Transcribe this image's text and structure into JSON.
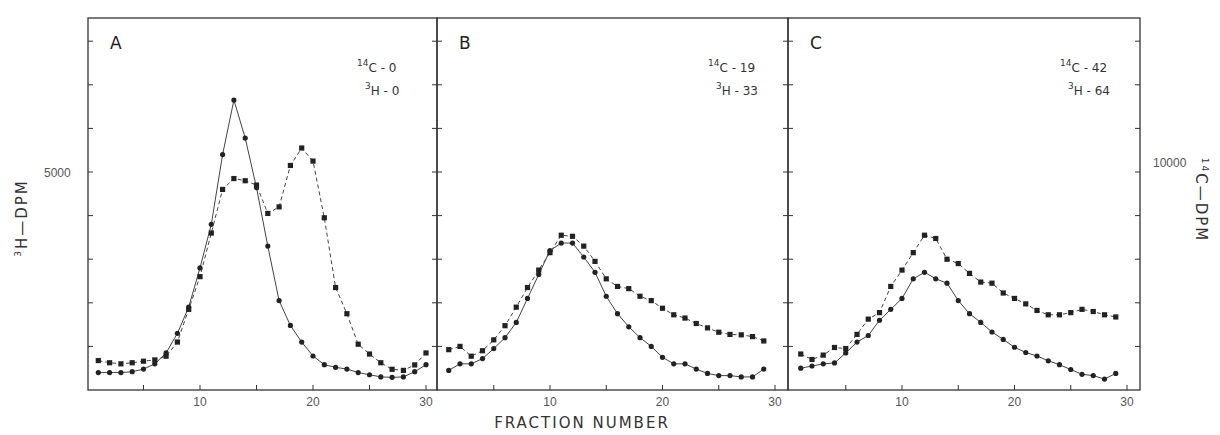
{
  "figure": {
    "y_left_label_sup": "3",
    "y_left_label": "H—DPM",
    "y_right_label_sup": "14",
    "y_right_label": "C—DPM",
    "x_label": "FRACTION NUMBER",
    "y_left_tick_label": "5000",
    "y_right_tick_label": "10000"
  },
  "chart_data": [
    {
      "type": "line",
      "panel": "A",
      "title": "A",
      "annotation": {
        "c14_label": "14C - 0",
        "h3_label": "3H - 0",
        "c14_sup": "14",
        "c14_text": "C - 0",
        "h3_sup": "3",
        "h3_text": "H - 0"
      },
      "xlabel": "FRACTION NUMBER",
      "ylabel": "3H-DPM",
      "ylabel_right": "14C-DPM",
      "xlim": [
        0,
        31
      ],
      "xticks": [
        10,
        20,
        30
      ],
      "ylim_left": [
        0,
        8000
      ],
      "ylim_right": [
        0,
        16000
      ],
      "x": [
        1,
        2,
        3,
        4,
        5,
        6,
        7,
        8,
        9,
        10,
        11,
        12,
        13,
        14,
        15,
        16,
        17,
        18,
        19,
        20,
        21,
        22,
        23,
        24,
        25,
        26,
        27,
        28,
        29,
        30
      ],
      "series": [
        {
          "name": "3H (solid, circles)",
          "axis": "left",
          "style": "solid",
          "values": [
            400,
            400,
            400,
            420,
            480,
            600,
            850,
            1300,
            1900,
            2800,
            3800,
            5400,
            6650,
            5780,
            4640,
            3300,
            2050,
            1480,
            1100,
            780,
            580,
            520,
            480,
            400,
            350,
            300,
            290,
            300,
            420,
            580
          ]
        },
        {
          "name": "14C (dashed, squares)",
          "axis": "right",
          "style": "dashed",
          "values": [
            1350,
            1250,
            1200,
            1250,
            1320,
            1380,
            1550,
            2200,
            3700,
            5200,
            7200,
            9200,
            9700,
            9600,
            9400,
            8100,
            8400,
            10300,
            11100,
            10500,
            7900,
            4700,
            3500,
            2100,
            1650,
            1250,
            950,
            900,
            1150,
            1700
          ]
        }
      ]
    },
    {
      "type": "line",
      "panel": "B",
      "title": "B",
      "annotation": {
        "c14_sup": "14",
        "c14_text": "C - 19",
        "h3_sup": "3",
        "h3_text": "H - 33"
      },
      "xlabel": "FRACTION NUMBER",
      "xlim": [
        0,
        31
      ],
      "xticks": [
        10,
        20,
        30
      ],
      "x": [
        1,
        2,
        3,
        4,
        5,
        6,
        7,
        8,
        9,
        10,
        11,
        12,
        13,
        14,
        15,
        16,
        17,
        18,
        19,
        20,
        21,
        22,
        23,
        24,
        25,
        26,
        27,
        28,
        29
      ],
      "series": [
        {
          "name": "3H (solid, circles)",
          "axis": "left",
          "style": "solid",
          "values": [
            450,
            600,
            600,
            720,
            950,
            1200,
            1550,
            2100,
            2650,
            3200,
            3370,
            3370,
            3050,
            2700,
            2150,
            1750,
            1450,
            1200,
            1000,
            750,
            600,
            600,
            480,
            380,
            330,
            330,
            300,
            300,
            480
          ]
        },
        {
          "name": "14C (dashed, squares)",
          "axis": "right",
          "style": "dashed",
          "values": [
            1850,
            2000,
            1550,
            1800,
            2300,
            2950,
            3800,
            4700,
            5500,
            6300,
            7100,
            7050,
            6600,
            5900,
            5100,
            4750,
            4650,
            4300,
            4100,
            3750,
            3450,
            3300,
            3050,
            2850,
            2650,
            2550,
            2530,
            2450,
            2250
          ]
        }
      ]
    },
    {
      "type": "line",
      "panel": "C",
      "title": "C",
      "annotation": {
        "c14_sup": "14",
        "c14_text": "C - 42",
        "h3_sup": "3",
        "h3_text": "H - 64"
      },
      "xlabel": "FRACTION NUMBER",
      "xlim": [
        0,
        31
      ],
      "xticks": [
        10,
        20,
        30
      ],
      "x": [
        1,
        2,
        3,
        4,
        5,
        6,
        7,
        8,
        9,
        10,
        11,
        12,
        13,
        14,
        15,
        16,
        17,
        18,
        19,
        20,
        21,
        22,
        23,
        24,
        25,
        26,
        27,
        28,
        29
      ],
      "series": [
        {
          "name": "3H (solid, circles)",
          "axis": "left",
          "style": "solid",
          "values": [
            500,
            550,
            600,
            620,
            850,
            1100,
            1250,
            1600,
            1850,
            2100,
            2550,
            2700,
            2550,
            2450,
            2050,
            1750,
            1550,
            1330,
            1160,
            980,
            860,
            780,
            670,
            580,
            470,
            360,
            330,
            250,
            380
          ]
        },
        {
          "name": "14C (dashed, squares)",
          "axis": "right",
          "style": "dashed",
          "values": [
            1650,
            1400,
            1600,
            1950,
            1900,
            2550,
            3250,
            3550,
            4750,
            5500,
            6300,
            7100,
            6950,
            6000,
            5800,
            5350,
            4950,
            4900,
            4450,
            4200,
            3950,
            3650,
            3450,
            3450,
            3550,
            3700,
            3600,
            3450,
            3350
          ]
        }
      ]
    }
  ]
}
